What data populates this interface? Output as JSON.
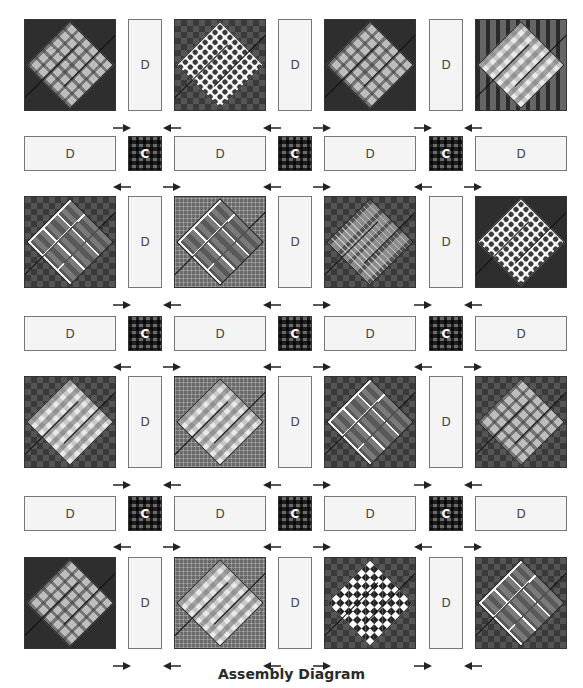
{
  "diagram": {
    "caption": "Assembly Diagram",
    "grid": {
      "block_rows": 4,
      "block_cols": 4
    },
    "labels": {
      "sashing_vertical": "D",
      "sashing_horizontal": "D",
      "cornerstone": "C"
    },
    "block_rows": [
      {
        "blocks": [
          {
            "background": "dark solid",
            "diamond": "light plaid"
          },
          {
            "background": "dark check",
            "diamond": "white dots"
          },
          {
            "background": "dark solid",
            "diamond": "light plaid"
          },
          {
            "background": "bar check",
            "diamond": "gingham"
          }
        ]
      },
      {
        "blocks": [
          {
            "background": "dark check",
            "diamond": "white-line plaid"
          },
          {
            "background": "grid plaid",
            "diamond": "white-line plaid"
          },
          {
            "background": "dark check",
            "diamond": "mid plaid"
          },
          {
            "background": "dark solid",
            "diamond": "white dots"
          }
        ]
      },
      {
        "blocks": [
          {
            "background": "dark check",
            "diamond": "gingham"
          },
          {
            "background": "grid plaid",
            "diamond": "gingham"
          },
          {
            "background": "dark check",
            "diamond": "white-line plaid"
          },
          {
            "background": "dark check",
            "diamond": "light plaid"
          }
        ]
      },
      {
        "blocks": [
          {
            "background": "dark solid",
            "diamond": "light plaid"
          },
          {
            "background": "grid plaid",
            "diamond": "gingham"
          },
          {
            "background": "dark check",
            "diamond": "checkerboard"
          },
          {
            "background": "dark check",
            "diamond": "white-line plaid"
          }
        ]
      }
    ],
    "pressing_arrows": {
      "block_row": [
        "right",
        "left",
        "left",
        "right",
        "right",
        "left"
      ],
      "sashing_row": [
        "left",
        "right",
        "left",
        "right",
        "left",
        "right"
      ]
    },
    "colors": {
      "sashing_fill": "#f4f4f4",
      "sashing_border": "#777777",
      "label_text": "#444444",
      "caption_text": "#2a2a2a"
    }
  }
}
